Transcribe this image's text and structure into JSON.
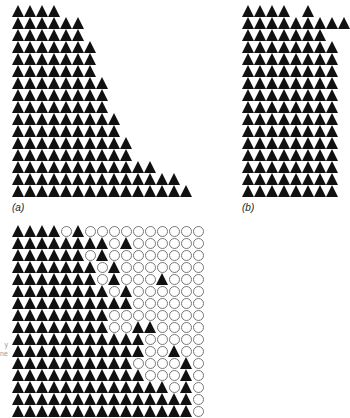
{
  "figure": {
    "panels": [
      {
        "id": "a",
        "label": "(a)",
        "left": 12,
        "top": 5,
        "row_counts": [
          4,
          6,
          6,
          7,
          7,
          7,
          8,
          8,
          8,
          9,
          9,
          10,
          10,
          12,
          14,
          15
        ]
      },
      {
        "id": "b",
        "label": "(b)",
        "left": 242,
        "top": 5,
        "rows": [
          "TTTT.T..",
          "TTTTTTTTT",
          "TTTTTTT.",
          "TTTTTTTT",
          "TTTTTTTT",
          "TTTTTTTT",
          "TTTTTTTT",
          "TTTTTTTT",
          "TTTTTTTT",
          "TTTTTTTT",
          "TTTTTTTT",
          "TTTTTTTT",
          "TTTTTTTT",
          "TTTTTTTT",
          "TTTTTTTT",
          "TTTTTTTT"
        ]
      },
      {
        "id": "c",
        "label": "",
        "left": 12,
        "top": 225,
        "rows": [
          "TTTTCTCCCCCCCCCC",
          "TTTTTTTTCTCCCCCC",
          "TTTTTTCTCCCCCCCC",
          "TTTTTTTCTCCCCCCC",
          "TTTTTTTCTCCCTCCC",
          "TTTTTTTTCTCCCCCC",
          "TTTTTTTTTTCCCCCC",
          "TTTTTTTTCCCCCCCC",
          "TTTTTTTTCCTTCCCC",
          "TTTTTTTTTTTCCCCC",
          "TTTTTTTTTTTCCTCC",
          "TTTTTTTTTTCCCCTC",
          "TTTTTTTTTTTCCCTC",
          "TTTTTTTTTTTTTCTC",
          "TTTTTTTTTTTTTTTC",
          "TTTTTTTTTTTTTTTC"
        ]
      }
    ],
    "side_note_lines": [
      "y",
      "ne"
    ]
  }
}
